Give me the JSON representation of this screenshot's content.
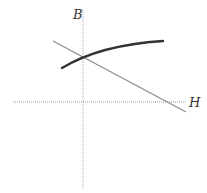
{
  "diagram": {
    "type": "B-H plot (magnetization curve with load line)",
    "axes": {
      "vertical_label": "B",
      "horizontal_label": "H",
      "style": "dotted"
    },
    "curves": [
      {
        "name": "magnetization-curve",
        "style": "thick solid",
        "color": "#333333"
      },
      {
        "name": "load-line",
        "style": "thin solid",
        "color": "#888888"
      }
    ],
    "colors": {
      "axis": "#999999",
      "curve": "#333333",
      "line": "#888888",
      "background": "#ffffff"
    }
  }
}
